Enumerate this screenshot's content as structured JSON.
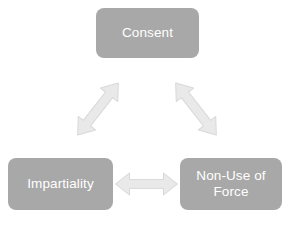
{
  "diagram": {
    "background_color": "#ffffff",
    "node_fill_color": "#a8a8a8",
    "node_text_color": "#ffffff",
    "arrow_fill_color": "#e9e9e9",
    "arrow_stroke_color": "#d5d5d5",
    "nodes": [
      {
        "id": "consent",
        "label": "Consent"
      },
      {
        "id": "impartiality",
        "label": "Impartiality"
      },
      {
        "id": "nonuse",
        "label": "Non-Use of\nForce"
      }
    ],
    "connectors": [
      {
        "id": "consent-impartiality",
        "name": "double-headed-diagonal-arrow-left",
        "from": "consent",
        "to": "impartiality",
        "direction": "bidirectional"
      },
      {
        "id": "consent-nonuse",
        "name": "double-headed-diagonal-arrow-right",
        "from": "consent",
        "to": "nonuse",
        "direction": "bidirectional"
      },
      {
        "id": "impartiality-nonuse",
        "name": "double-headed-horizontal-arrow",
        "from": "impartiality",
        "to": "nonuse",
        "direction": "bidirectional"
      }
    ]
  }
}
